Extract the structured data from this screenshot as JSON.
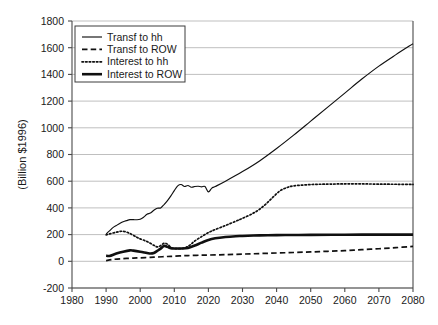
{
  "chart_data": {
    "type": "line",
    "title": "",
    "xlabel": "",
    "ylabel": "(Billion $1996)",
    "xlim": [
      1980,
      2080
    ],
    "ylim": [
      -200,
      1800
    ],
    "xticks": [
      1980,
      1990,
      2000,
      2010,
      2020,
      2030,
      2040,
      2050,
      2060,
      2070,
      2080
    ],
    "yticks": [
      -200,
      0,
      200,
      400,
      600,
      800,
      1000,
      1200,
      1400,
      1600,
      1800
    ],
    "grid": "horizontal",
    "legend_position": "top-left",
    "series": [
      {
        "name": "Transf to hh",
        "style": "solid-thin",
        "x": [
          1990,
          1991,
          1992,
          1993,
          1994,
          1995,
          1996,
          1997,
          1998,
          1999,
          2000,
          2001,
          2002,
          2003,
          2004,
          2005,
          2006,
          2007,
          2008,
          2009,
          2010,
          2011,
          2012,
          2013,
          2014,
          2015,
          2016,
          2017,
          2018,
          2019,
          2020,
          2021,
          2022,
          2025,
          2030,
          2035,
          2040,
          2045,
          2050,
          2055,
          2060,
          2065,
          2070,
          2075,
          2080
        ],
        "values": [
          205,
          228,
          252,
          268,
          283,
          296,
          305,
          312,
          312,
          311,
          315,
          330,
          352,
          362,
          382,
          398,
          400,
          425,
          455,
          490,
          530,
          565,
          575,
          560,
          568,
          555,
          560,
          562,
          558,
          560,
          520,
          548,
          560,
          600,
          672,
          752,
          845,
          945,
          1050,
          1155,
          1260,
          1365,
          1462,
          1548,
          1630
        ]
      },
      {
        "name": "Transf to ROW",
        "style": "dashed",
        "x": [
          1990,
          1992,
          1995,
          1998,
          2000,
          2003,
          2005,
          2008,
          2010,
          2013,
          2015,
          2018,
          2020,
          2025,
          2030,
          2035,
          2040,
          2045,
          2050,
          2055,
          2060,
          2065,
          2070,
          2075,
          2080
        ],
        "values": [
          5,
          14,
          20,
          24,
          26,
          30,
          32,
          36,
          38,
          42,
          44,
          46,
          47,
          50,
          54,
          58,
          62,
          66,
          70,
          75,
          80,
          87,
          94,
          102,
          112
        ]
      },
      {
        "name": "Interest to hh",
        "style": "dotted",
        "x": [
          1990,
          1991,
          1993,
          1995,
          1997,
          1999,
          2000,
          2002,
          2004,
          2005,
          2006,
          2007,
          2008,
          2009,
          2010,
          2011,
          2012,
          2013,
          2014,
          2015,
          2016,
          2018,
          2020,
          2022,
          2025,
          2028,
          2030,
          2033,
          2035,
          2037,
          2039,
          2041,
          2043,
          2045,
          2050,
          2055,
          2060,
          2065,
          2070,
          2075,
          2080
        ],
        "values": [
          198,
          205,
          218,
          225,
          208,
          180,
          168,
          148,
          120,
          108,
          118,
          135,
          128,
          105,
          96,
          95,
          96,
          100,
          112,
          130,
          152,
          185,
          215,
          238,
          268,
          300,
          322,
          358,
          390,
          432,
          482,
          528,
          552,
          565,
          575,
          578,
          580,
          580,
          578,
          577,
          576
        ]
      },
      {
        "name": "Interest to ROW",
        "style": "solid-thick",
        "x": [
          1990,
          1991,
          1993,
          1995,
          1997,
          1998,
          2000,
          2002,
          2003,
          2004,
          2005,
          2006,
          2007,
          2008,
          2009,
          2010,
          2012,
          2014,
          2016,
          2018,
          2020,
          2022,
          2025,
          2028,
          2030,
          2035,
          2040,
          2045,
          2050,
          2060,
          2070,
          2080
        ],
        "values": [
          42,
          40,
          58,
          72,
          82,
          80,
          72,
          62,
          58,
          62,
          78,
          95,
          115,
          108,
          98,
          96,
          96,
          100,
          118,
          140,
          160,
          172,
          182,
          188,
          190,
          194,
          196,
          197,
          198,
          199,
          200,
          200
        ]
      }
    ]
  },
  "legend": {
    "items": [
      {
        "label": "Transf to hh",
        "style": "solid-thin"
      },
      {
        "label": "Transf to ROW",
        "style": "dashed"
      },
      {
        "label": "Interest to hh",
        "style": "dotted"
      },
      {
        "label": "Interest to ROW",
        "style": "solid-thick"
      }
    ]
  }
}
